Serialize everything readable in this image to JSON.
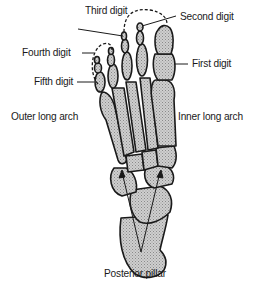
{
  "diagram": {
    "labels": {
      "third_digit": "Third digit",
      "second_digit": "Second digit",
      "fourth_digit": "Fourth digit",
      "first_digit": "First digit",
      "fifth_digit": "Fifth digit",
      "outer_long_arch": "Outer long arch",
      "inner_long_arch": "Inner long arch",
      "posterior_pillar": "Posterior pillar"
    },
    "colors": {
      "bone_fill": "#c8c8c8",
      "outline": "#1a1a1a",
      "text": "#1a1a1a",
      "background": "#ffffff"
    }
  }
}
